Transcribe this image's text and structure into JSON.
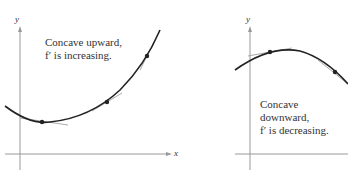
{
  "left_graph": {
    "title_line1": "Concave upward,",
    "title_line2": "f′ is increasing.",
    "y_label": "y",
    "x_label": "x",
    "points": [
      [
        42,
        122
      ],
      [
        107,
        102
      ],
      [
        147,
        56
      ]
    ]
  },
  "right_graph": {
    "title_line1": "Concave downward,",
    "title_line2": "f′ is decreasing.",
    "y_label": "y",
    "points": [
      [
        270,
        52
      ],
      [
        335,
        72
      ]
    ]
  },
  "colors": {
    "curve": "#222222",
    "axis": "#999999",
    "tangent": "#aaaaaa"
  }
}
